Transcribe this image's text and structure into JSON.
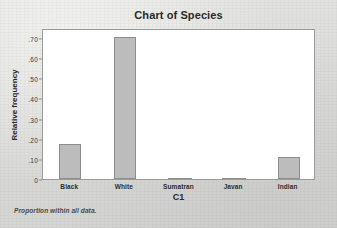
{
  "chart_data": {
    "type": "bar",
    "title": "Chart of Species",
    "xlabel": "C1",
    "ylabel": "Relative frequency",
    "categories": [
      "Black",
      "White",
      "Sumatran",
      "Javan",
      "Indian"
    ],
    "values": [
      0.175,
      0.705,
      0.003,
      0.002,
      0.11
    ],
    "ylim": [
      0,
      0.75
    ],
    "yticks": [
      0,
      0.1,
      0.2,
      0.3,
      0.4,
      0.5,
      0.6,
      0.7
    ],
    "ytick_labels": [
      "0",
      ".10",
      ".20",
      ".30",
      ".40",
      ".50",
      ".60",
      ".70"
    ],
    "grid": false,
    "legend": "none",
    "footnote": "Proportion within all data.",
    "bar_fill_color": "#bcbcbc",
    "bar_border_color": "#8d8d8d",
    "plot_background_color": "#ffffff",
    "page_background_color": "#dcdcda"
  },
  "bleed_through": {
    "top_line": "",
    "mid_line": "",
    "low_line": ""
  }
}
